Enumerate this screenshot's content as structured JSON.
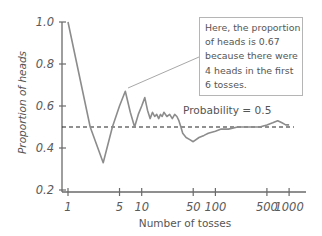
{
  "chart_data": {
    "type": "line",
    "title": "",
    "xlabel": "Number of tosses",
    "ylabel": "Proportion of heads",
    "xscale": "log",
    "xlim": [
      1,
      1300
    ],
    "ylim": [
      0.2,
      1.0
    ],
    "xticks": [
      1,
      5,
      10,
      50,
      100,
      500,
      1000
    ],
    "xtick_labels": [
      "1",
      "5",
      "10",
      "50",
      "100",
      "500",
      "1000"
    ],
    "yticks": [
      0.2,
      0.4,
      0.6,
      0.8,
      1.0
    ],
    "ytick_labels": [
      "0.2",
      "0.4",
      "0.6",
      "0.8",
      "1.0"
    ],
    "grid": false,
    "series": [
      {
        "name": "Proportion of heads",
        "color": "#8c8c8c",
        "x": [
          1,
          2,
          3,
          4,
          5,
          6,
          7,
          8,
          9,
          10,
          11,
          12,
          13,
          14,
          15,
          16,
          17,
          18,
          19,
          20,
          22,
          24,
          26,
          28,
          30,
          32,
          34,
          36,
          40,
          45,
          50,
          60,
          70,
          80,
          100,
          120,
          150,
          200,
          250,
          300,
          400,
          500,
          600,
          700,
          800,
          900,
          1000
        ],
        "values": [
          1.0,
          0.5,
          0.33,
          0.5,
          0.6,
          0.67,
          0.57,
          0.5,
          0.56,
          0.6,
          0.64,
          0.58,
          0.54,
          0.57,
          0.55,
          0.56,
          0.54,
          0.56,
          0.55,
          0.57,
          0.55,
          0.56,
          0.54,
          0.56,
          0.55,
          0.53,
          0.5,
          0.47,
          0.45,
          0.44,
          0.43,
          0.45,
          0.46,
          0.47,
          0.48,
          0.49,
          0.49,
          0.5,
          0.5,
          0.5,
          0.5,
          0.51,
          0.52,
          0.53,
          0.52,
          0.51,
          0.51
        ]
      }
    ],
    "reference_lines": [
      {
        "y": 0.5,
        "style": "dashed",
        "color": "#222222",
        "label": "Probability = 0.5"
      }
    ],
    "annotations": [
      {
        "text": "Here, the proportion of heads is 0.67 because there were 4 heads in the first 6 tosses.",
        "lines": [
          "Here, the proportion",
          "of heads is 0.67",
          "because there were",
          "4 heads in the first",
          "6 tosses."
        ],
        "points_to": {
          "x": 6,
          "y": 0.67
        }
      }
    ]
  },
  "labels": {
    "ylabel": "Proportion of heads",
    "xlabel": "Number of tosses",
    "probability": "Probability = 0.5",
    "note": [
      "Here, the proportion",
      "of heads is 0.67",
      "because there were",
      "4 heads in the first",
      "6 tosses."
    ]
  }
}
